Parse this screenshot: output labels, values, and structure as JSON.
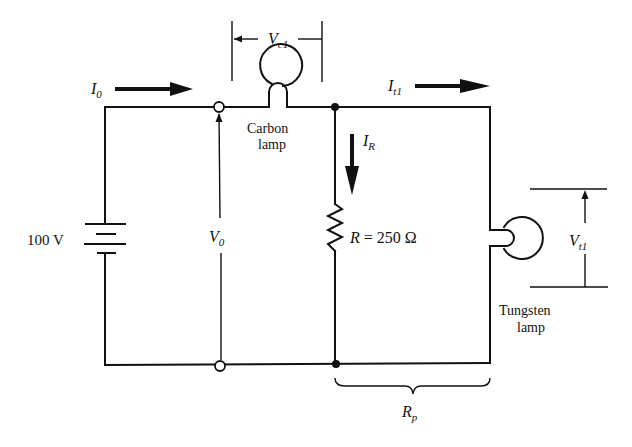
{
  "diagram": {
    "type": "circuit",
    "source": {
      "label": "100 V",
      "kind": "battery"
    },
    "components": {
      "carbon_lamp": {
        "label_line1": "Carbon",
        "label_line2": "lamp",
        "voltage_symbol": "V",
        "voltage_sub": "c1"
      },
      "resistor": {
        "symbol": "R",
        "equals": " = 250 Ω",
        "value_ohms": 250
      },
      "tungsten_lamp": {
        "label_line1": "Tungsten",
        "label_line2": "lamp",
        "voltage_symbol": "V",
        "voltage_sub": "t1"
      }
    },
    "currents": {
      "I0": {
        "symbol": "I",
        "sub": "0"
      },
      "It1": {
        "symbol": "I",
        "sub": "t1"
      },
      "IR": {
        "symbol": "I",
        "sub": "R"
      }
    },
    "voltages": {
      "V0": {
        "symbol": "V",
        "sub": "0"
      }
    },
    "equivalent": {
      "symbol": "R",
      "sub": "p"
    }
  }
}
